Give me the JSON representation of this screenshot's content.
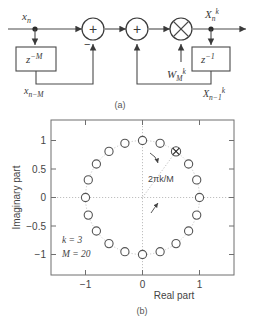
{
  "figure": {
    "panel_a": {
      "caption": "(a)",
      "input_label": "x",
      "input_sub": "n",
      "delay_m_label": "z",
      "delay_m_exp": "−M",
      "delay_m_out_label": "x",
      "delay_m_out_sub": "n−M",
      "adder1_symbol": "+",
      "adder1_minus_sign": "−",
      "adder2_symbol": "+",
      "multiplier_symbol": "✕",
      "twiddle_label": "W",
      "twiddle_sub": "M",
      "twiddle_sup": "k",
      "output_label": "X",
      "output_sub": "n",
      "output_sup": "k",
      "delay_1_label": "z",
      "delay_1_exp": "−1",
      "delay_1_out_label": "X",
      "delay_1_out_sub": "n−1",
      "delay_1_out_sup": "k"
    },
    "panel_b": {
      "caption": "(b)",
      "angle_annotation": "2πk/M",
      "param_k": "k = 3",
      "param_m": "M = 20",
      "xlabel": "Real part",
      "ylabel": "Imaginary part",
      "xticks": [
        "−1",
        "0",
        "1"
      ],
      "yticks": [
        "1",
        "0.5",
        "0",
        "−0.5",
        "−1"
      ]
    }
  },
  "chart_data": {
    "type": "scatter",
    "title": "",
    "xlabel": "Real part",
    "ylabel": "Imaginary part",
    "xlim": [
      -1.45,
      1.45
    ],
    "ylim": [
      -1.38,
      1.38
    ],
    "xticks": [
      -1,
      0,
      1
    ],
    "yticks": [
      -1,
      -0.5,
      0,
      0.5,
      1
    ],
    "grid": true,
    "legend": null,
    "k": 3,
    "M": 20,
    "annotations": [
      "2πk/M",
      "k = 3",
      "M = 20"
    ],
    "series": [
      {
        "name": "M-th roots of unity",
        "marker": "open-circle",
        "x": [
          1.0,
          0.951,
          0.809,
          0.588,
          0.309,
          0.0,
          -0.309,
          -0.588,
          -0.809,
          -0.951,
          -1.0,
          -0.951,
          -0.809,
          -0.588,
          -0.309,
          0.0,
          0.309,
          0.588,
          0.809,
          0.951
        ],
        "y": [
          0.0,
          0.309,
          0.588,
          0.809,
          0.951,
          1.0,
          0.951,
          0.809,
          0.588,
          0.309,
          0.0,
          -0.309,
          -0.588,
          -0.809,
          -0.951,
          -1.0,
          -0.951,
          -0.809,
          -0.588,
          -0.309
        ]
      },
      {
        "name": "selected bin k=3",
        "marker": "circle-with-x",
        "x": [
          0.588
        ],
        "y": [
          0.809
        ]
      }
    ]
  }
}
